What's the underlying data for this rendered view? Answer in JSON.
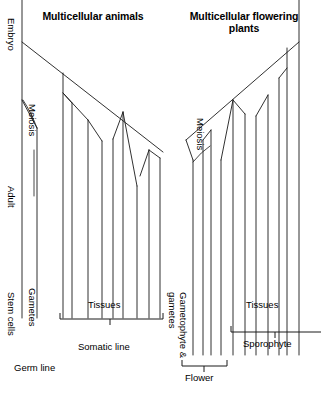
{
  "titles": {
    "left": "Multicellular animals",
    "right": "Multicellular flowering plants"
  },
  "labels": {
    "embryo": "Embryo",
    "adult": "Adult",
    "meiosis_left": "Meiosis",
    "meiosis_right": "Meiosis",
    "gametes": "Gametes",
    "stem_cells": "Stem cells",
    "germ_line": "Germ line",
    "tissues_left": "Tissues",
    "tissues_right": "Tissues",
    "somatic_line": "Somatic line",
    "gametophyte_gametes": "Gametophyte & gametes",
    "sporophyte": "Sporophyte",
    "flower": "Flower"
  },
  "colors": {
    "ink": "#000000",
    "line": "#1a1a1a",
    "background": "#ffffff"
  },
  "diagram": {
    "type": "cell-lineage-tree",
    "stroke_width": 0.9,
    "left_panel": {
      "name": "multicellular-animals",
      "germline_stem_axis_x": 22,
      "germline_stem_axis": {
        "x1": 22,
        "y1": 0,
        "x2": 22,
        "y2": 318
      },
      "gamete_branch": {
        "from_x": 22,
        "from_y": 100,
        "to_x": 37,
        "to_y": 128,
        "stem_to_y": 318
      },
      "main_diagonal": {
        "x1": 22,
        "y1": 42,
        "x2": 163,
        "y2": 152
      },
      "somatic_verticals_top_to_bottom": [
        {
          "x": 63,
          "y_top": 73,
          "y_bottom": 318
        },
        {
          "x": 72,
          "y_top": 103,
          "y_bottom": 318
        },
        {
          "x": 88,
          "y_top": 120,
          "y_bottom": 318
        },
        {
          "x": 102,
          "y_top": 141,
          "y_bottom": 318
        },
        {
          "x": 113,
          "y_top": 139,
          "y_bottom": 318
        },
        {
          "x": 123,
          "y_top": 112,
          "y_bottom": 318
        },
        {
          "x": 137,
          "y_top": 186,
          "y_bottom": 318
        },
        {
          "x": 149,
          "y_top": 150,
          "y_bottom": 318
        },
        {
          "x": 160,
          "y_top": 158,
          "y_bottom": 318
        }
      ],
      "branch_joints": [
        {
          "x1": 63,
          "y1": 93,
          "x2": 72,
          "y2": 103
        },
        {
          "x1": 63,
          "y1": 93,
          "x2": 88,
          "y2": 120
        },
        {
          "x1": 88,
          "y1": 120,
          "x2": 102,
          "y2": 141
        },
        {
          "x1": 123,
          "y1": 112,
          "x2": 113,
          "y2": 139
        },
        {
          "x1": 123,
          "y1": 112,
          "x2": 137,
          "y2": 186
        },
        {
          "x1": 149,
          "y1": 150,
          "x2": 160,
          "y2": 158
        },
        {
          "x1": 149,
          "y1": 150,
          "x2": 140,
          "y2": 176
        }
      ],
      "tissues_bracket": {
        "x1": 60,
        "x2": 163,
        "y": 319,
        "tick_x": 110
      },
      "somatic_label_y": 347
    },
    "right_panel": {
      "name": "multicellular-flowering-plants",
      "gametophyte_axis_x": 193,
      "gametophyte_axis": {
        "x1": 193,
        "y1": 160,
        "x2": 193,
        "y2": 355
      },
      "sporophyte_axis_x": 299,
      "main_diagonal": {
        "x1": 186,
        "y1": 140,
        "x2": 299,
        "y2": 42
      },
      "somatic_verticals_top_to_bottom": [
        {
          "x": 299,
          "y_top": 0,
          "y_bottom": 355
        },
        {
          "x": 287,
          "y_top": 48,
          "y_bottom": 355
        },
        {
          "x": 279,
          "y_top": 78,
          "y_bottom": 355
        },
        {
          "x": 268,
          "y_top": 95,
          "y_bottom": 355
        },
        {
          "x": 256,
          "y_top": 116,
          "y_bottom": 355
        },
        {
          "x": 245,
          "y_top": 114,
          "y_bottom": 355
        },
        {
          "x": 233,
          "y_top": 100,
          "y_bottom": 355
        },
        {
          "x": 221,
          "y_top": 160,
          "y_bottom": 355
        },
        {
          "x": 211,
          "y_top": 130,
          "y_bottom": 355
        },
        {
          "x": 203,
          "y_top": 140,
          "y_bottom": 355
        }
      ],
      "branch_joints": [
        {
          "x1": 287,
          "y1": 68,
          "x2": 279,
          "y2": 78
        },
        {
          "x1": 268,
          "y1": 95,
          "x2": 256,
          "y2": 116
        },
        {
          "x1": 233,
          "y1": 100,
          "x2": 245,
          "y2": 114
        },
        {
          "x1": 233,
          "y1": 100,
          "x2": 221,
          "y2": 160
        },
        {
          "x1": 211,
          "y1": 130,
          "x2": 203,
          "y2": 140
        }
      ],
      "sporophyte_bracket": {
        "x1": 231,
        "x2": 321,
        "y": 332,
        "tick_x": 275
      },
      "flower_bracket": {
        "x1": 182,
        "x2": 227,
        "y": 366,
        "tick_x": 204
      },
      "sporophyte_label_y": 344,
      "flower_label_y": 374
    }
  }
}
